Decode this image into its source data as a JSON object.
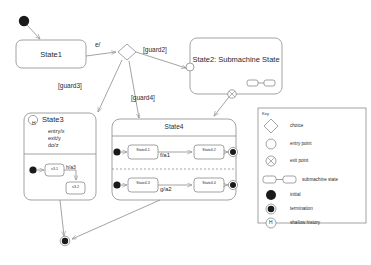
{
  "diagram": {
    "stroke": "#8c8c8c",
    "text_color": "#2b2b2b",
    "fill": "#ffffff",
    "solid_node": "#1a1a1a"
  },
  "states": {
    "state1": {
      "name": "State1"
    },
    "state2": {
      "name": "State2: Submachine State"
    },
    "state3": {
      "name": "State3",
      "history_icon": "H",
      "entry": "entry/x",
      "exit": "exit/y",
      "do": "do/z",
      "sub1": "s3.1",
      "sub2": "s3.2",
      "transition": "h/a3"
    },
    "state4": {
      "name": "State4",
      "region1": {
        "from": "State4.1",
        "to": "State4.2",
        "transition": "f/a1"
      },
      "region2": {
        "from": "State4.3",
        "to": "State4.4",
        "transition": "g/a2"
      }
    }
  },
  "transitions": {
    "trigger_e": "e/",
    "guard2": "[guard2]",
    "guard3": "[guard3]",
    "guard4": "[guard4]"
  },
  "key": {
    "title": "Key",
    "items": [
      {
        "icon": "choice-diamond-icon",
        "label": "choice"
      },
      {
        "icon": "entry-point-circle-icon",
        "label": "entry point"
      },
      {
        "icon": "exit-point-circle-x-icon",
        "label": "exit point"
      },
      {
        "icon": "submachine-state-icon",
        "label": "submachine state"
      },
      {
        "icon": "initial-node-icon",
        "label": "initial"
      },
      {
        "icon": "termination-node-icon",
        "label": "termination"
      },
      {
        "icon": "shallow-history-icon",
        "label": "shallow history"
      }
    ]
  }
}
